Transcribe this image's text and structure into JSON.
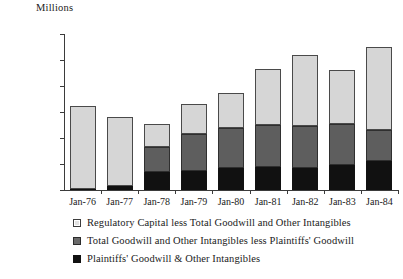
{
  "chart_data": {
    "type": "bar",
    "title": "",
    "subtitle": "",
    "stacked": true,
    "unit_label": "Millions",
    "xlabel": "",
    "ylabel": "",
    "ylim": [
      0,
      60000
    ],
    "ytick_step": 10000,
    "grid": false,
    "legend_position": "bottom",
    "categories": [
      "Jan-76",
      "Jan-77",
      "Jan-78",
      "Jan-79",
      "Jan-80",
      "Jan-81",
      "Jan-82",
      "Jan-83",
      "Jan-84"
    ],
    "ytick_labels": [
      "$60,000",
      "$50,000",
      "$40,000",
      "$30,000",
      "$20,000",
      "$10,000",
      "$0"
    ],
    "ytick_values": [
      60000,
      50000,
      40000,
      30000,
      20000,
      10000,
      0
    ],
    "series": [
      {
        "name": "Plaintiffs' Goodwill & Other Intangibles",
        "color": "#111111",
        "values": [
          300,
          1500,
          7000,
          7500,
          8500,
          8800,
          8500,
          9500,
          11000
        ]
      },
      {
        "name": "Total Goodwill and Other Intangibles less Plaintiffs' Goodwill",
        "color": "#5e5e5e",
        "values": [
          0,
          0,
          9500,
          14000,
          15300,
          16200,
          16000,
          16000,
          12000
        ]
      },
      {
        "name": "Regulatory Capital less Total Goodwill and Other Intangibles",
        "color": "#d6d6d6",
        "values": [
          32200,
          26500,
          9000,
          11500,
          13400,
          21500,
          27500,
          20500,
          32000
        ]
      }
    ],
    "totals": [
      32500,
      28000,
      25500,
      33000,
      37200,
      46500,
      52000,
      46000,
      55000
    ]
  },
  "legend": {
    "items": [
      {
        "label": "Regulatory Capital less Total Goodwill and Other Intangibles",
        "swatch": "light-gray-square-icon"
      },
      {
        "label": "Total Goodwill and Other Intangibles less Plaintiffs' Goodwill",
        "swatch": "mid-gray-square-icon"
      },
      {
        "label": "Plaintiffs' Goodwill & Other Intangibles",
        "swatch": "black-square-icon"
      }
    ]
  }
}
